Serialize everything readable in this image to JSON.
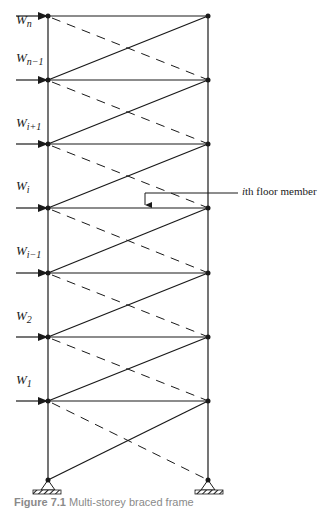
{
  "figure": {
    "type": "multi-storey braced frame",
    "left_column_x": 48,
    "right_column_x": 208,
    "base_y": 480,
    "floors_y": [
      16,
      80,
      144,
      208,
      273,
      337,
      401
    ],
    "line_color": "#1a1a1a"
  },
  "loads": [
    {
      "base": "W",
      "sub": "n",
      "label_y": 24
    },
    {
      "base": "W",
      "sub": "n−1",
      "label_y": 62
    },
    {
      "base": "W",
      "sub": "i+1",
      "label_y": 127
    },
    {
      "base": "W",
      "sub": "i",
      "label_y": 190
    },
    {
      "base": "W",
      "sub": "i−1",
      "label_y": 255
    },
    {
      "base": "W",
      "sub": "2",
      "label_y": 320
    },
    {
      "base": "W",
      "sub": "1",
      "label_y": 384
    }
  ],
  "annotation": {
    "italic_part": "i",
    "text": "th floor member"
  },
  "caption": {
    "label": "Figure 7.1",
    "text": "Multi-storey braced frame"
  }
}
